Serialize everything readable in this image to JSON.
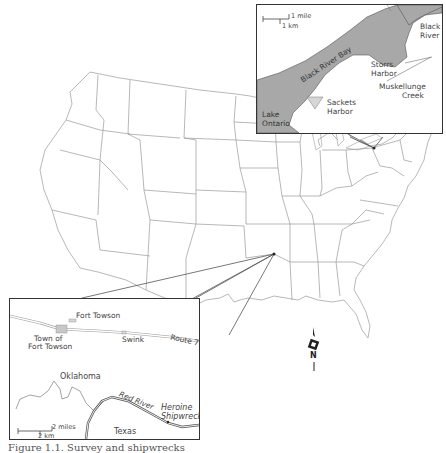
{
  "figure": {
    "caption": "Figure 1.1. Survey and shipwrecks",
    "main_map": {
      "subject": "Contiguous United States",
      "stroke_color": "#9a9a9a",
      "callout_points": [
        {
          "name": "oklahoma-site",
          "x": 274,
          "y": 254
        },
        {
          "name": "new-york-site",
          "x": 374,
          "y": 148
        }
      ]
    },
    "north_arrow": {
      "label": "N"
    },
    "inset_new_york": {
      "scale_mile": "1 mile",
      "scale_km": "1 km",
      "water_color": "#a8a8a8",
      "harbor_color": "#d6d6d6",
      "labels": {
        "black_river": "Black River",
        "black_river_line1": "Black",
        "black_river_line2": "River",
        "black_river_bay": "Black River Bay",
        "storrs_harbor_line1": "Storrs",
        "storrs_harbor_line2": "Harbor",
        "muskellunge_line1": "Muskellunge",
        "muskellunge_line2": "Creek",
        "sackets_line1": "Sackets",
        "sackets_line2": "Harbor",
        "lake_line1": "Lake",
        "lake_line2": "Ontario"
      }
    },
    "inset_oklahoma": {
      "scale_miles": "2 miles",
      "scale_km": "2 km",
      "town_color": "#c8c8c8",
      "labels": {
        "fort_towson": "Fort Towson",
        "town_line1": "Town of",
        "town_line2": "Fort Towson",
        "swink": "Swink",
        "route": "Route 70",
        "oklahoma": "Oklahoma",
        "red_river": "Red River",
        "shipwreck_line1": "Heroine",
        "shipwreck_line2": "Shipwreck",
        "texas": "Texas"
      }
    }
  }
}
